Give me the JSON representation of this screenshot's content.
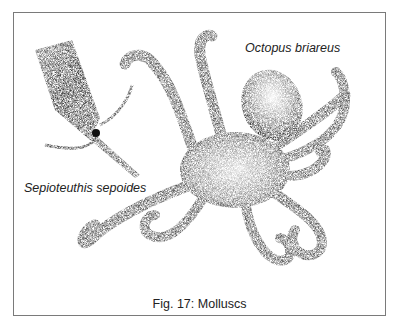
{
  "figure": {
    "caption": "Fig. 17: Molluscs",
    "labels": {
      "octopus": "Octopus briareus",
      "squid": "Sepioteuthis sepoides"
    },
    "illustrations": [
      {
        "subject": "octopus",
        "style": "stipple-ink"
      },
      {
        "subject": "squid",
        "style": "stipple-ink"
      }
    ],
    "colors": {
      "border": "#7a7a7a",
      "ink": "#1a1a1a",
      "background": "#ffffff"
    }
  }
}
